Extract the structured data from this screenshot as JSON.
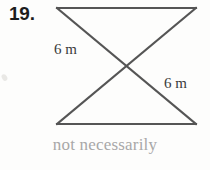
{
  "problem": {
    "number": "19."
  },
  "figure": {
    "name": "bowtie-crossed-segments",
    "stroke_color": "#555555",
    "stroke_width": 2,
    "background_color": "#fdfdfc",
    "vertices": {
      "top_left": [
        57,
        8
      ],
      "top_right": [
        196,
        8
      ],
      "bottom_left": [
        57,
        124
      ],
      "bottom_right": [
        196,
        124
      ],
      "crossing": [
        126.5,
        66
      ]
    },
    "segments": [
      {
        "name": "top-edge",
        "from": [
          57,
          8
        ],
        "to": [
          196,
          8
        ]
      },
      {
        "name": "bottom-edge",
        "from": [
          57,
          124
        ],
        "to": [
          196,
          124
        ]
      },
      {
        "name": "diagonal-top-left-to-bottom-right",
        "from": [
          57,
          8
        ],
        "to": [
          196,
          124
        ]
      },
      {
        "name": "diagonal-top-right-to-bottom-left",
        "from": [
          196,
          8
        ],
        "to": [
          57,
          124
        ]
      }
    ],
    "labels": {
      "left": "6 m",
      "right": "6 m"
    }
  },
  "caption": {
    "text": "not necessarily",
    "color": "#a8a8a8"
  }
}
